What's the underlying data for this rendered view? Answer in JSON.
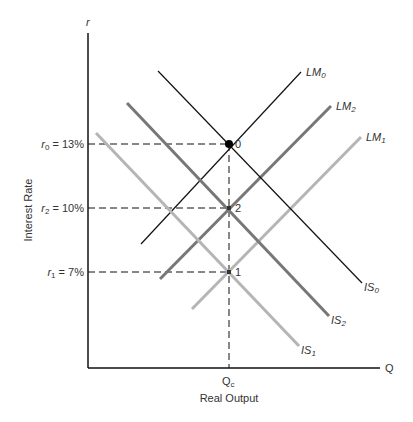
{
  "chart_data": {
    "type": "line",
    "title": "",
    "xlabel": "Real Output",
    "ylabel": "Interest Rate",
    "x_axis_symbol": "Q",
    "y_axis_symbol": "r",
    "x_ticks": [
      {
        "label": "Qc",
        "main": "Q",
        "sub": "c"
      }
    ],
    "y_ticks": [
      {
        "label": "r0 = 13%",
        "sym": "r",
        "sub": "0",
        "value": "= 13%",
        "y": 13
      },
      {
        "label": "r2 = 10%",
        "sym": "r",
        "sub": "2",
        "value": "= 10%",
        "y": 10
      },
      {
        "label": "r1 = 7%",
        "sym": "r",
        "sub": "1",
        "value": "=   7%",
        "y": 7
      }
    ],
    "series": [
      {
        "name": "LM0",
        "main": "LM",
        "sub": "0",
        "kind": "LM",
        "color": "#111111",
        "width": 1.2,
        "x1": 141,
        "y1": 244,
        "x2": 301,
        "y2": 72
      },
      {
        "name": "LM2",
        "main": "LM",
        "sub": "2",
        "kind": "LM",
        "color": "#777777",
        "width": 3,
        "x1": 160,
        "y1": 279,
        "x2": 331,
        "y2": 106
      },
      {
        "name": "LM1",
        "main": "LM",
        "sub": "1",
        "kind": "LM",
        "color": "#b5b5b5",
        "width": 3,
        "x1": 192,
        "y1": 309,
        "x2": 361,
        "y2": 137
      },
      {
        "name": "IS0",
        "main": "IS",
        "sub": "0",
        "kind": "IS",
        "color": "#111111",
        "width": 1.2,
        "x1": 158,
        "y1": 71,
        "x2": 362,
        "y2": 283
      },
      {
        "name": "IS2",
        "main": "IS",
        "sub": "2",
        "kind": "IS",
        "color": "#777777",
        "width": 3,
        "x1": 127,
        "y1": 103,
        "x2": 329,
        "y2": 316
      },
      {
        "name": "IS1",
        "main": "IS",
        "sub": "1",
        "kind": "IS",
        "color": "#b5b5b5",
        "width": 3,
        "x1": 96,
        "y1": 133,
        "x2": 299,
        "y2": 346
      }
    ],
    "points": [
      {
        "label": "0",
        "r": 13,
        "x": 229,
        "y": 144
      },
      {
        "label": "2",
        "r": 10,
        "x": 229,
        "y": 208
      },
      {
        "label": "1",
        "r": 7,
        "x": 229,
        "y": 272
      }
    ],
    "grid": false,
    "legend": "inline line labels"
  }
}
